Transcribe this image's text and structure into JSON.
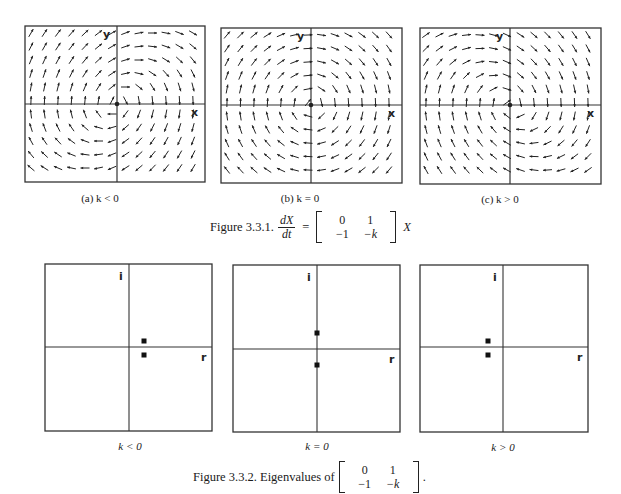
{
  "figure1": {
    "title": "Figure 3.3.1.",
    "equation": {
      "lhs_num": "dX",
      "lhs_den": "dt",
      "equals": "=",
      "matrix": [
        [
          "0",
          "1"
        ],
        [
          "−1",
          "−k"
        ]
      ],
      "rhs": "X"
    },
    "panels": [
      {
        "id": "a",
        "caption": "(a) k < 0",
        "k": -0.5,
        "box": [
          25,
          26,
          180,
          156
        ],
        "origin": [
          117,
          104
        ],
        "x_label": "x",
        "y_label": "y"
      },
      {
        "id": "b",
        "caption": "(b)  k = 0",
        "k": 0,
        "box": [
          221,
          28,
          181,
          155
        ],
        "origin": [
          311,
          105
        ],
        "x_label": "x",
        "y_label": "y"
      },
      {
        "id": "c",
        "caption": "(c)  k > 0",
        "k": 0.5,
        "box": [
          420,
          28,
          181,
          156
        ],
        "origin": [
          510,
          105
        ],
        "x_label": "x",
        "y_label": "y"
      }
    ]
  },
  "figure2": {
    "title": "Figure 3.3.2. Eigenvalues of",
    "matrix": [
      [
        "0",
        "1"
      ],
      [
        "−1",
        "−k"
      ]
    ],
    "trailing": ".",
    "panels": [
      {
        "caption": "k < 0",
        "box": [
          45,
          264,
          167,
          167
        ],
        "origin": [
          129,
          347
        ],
        "imag_label": "i",
        "real_label": "r",
        "eigenvalues": [
          [
            144,
            341
          ],
          [
            144,
            355
          ]
        ]
      },
      {
        "caption": "k = 0",
        "box": [
          233,
          265,
          167,
          167
        ],
        "origin": [
          317,
          349
        ],
        "imag_label": "i",
        "real_label": "r",
        "eigenvalues": [
          [
            317,
            333
          ],
          [
            317,
            365
          ]
        ]
      },
      {
        "caption": "k > 0",
        "box": [
          420,
          265,
          168,
          167
        ],
        "origin": [
          503,
          347
        ],
        "imag_label": "i",
        "real_label": "r",
        "eigenvalues": [
          [
            488,
            341
          ],
          [
            488,
            355
          ]
        ]
      }
    ]
  },
  "chart_data": [
    {
      "type": "vector_field",
      "title": "(a) k < 0",
      "system": "dx/dt = y, dy/dt = -x - k y",
      "k_sign": "negative",
      "behavior": "spiral source (unstable)",
      "axes": {
        "x": "x",
        "y": "y"
      }
    },
    {
      "type": "vector_field",
      "title": "(b) k = 0",
      "system": "dx/dt = y, dy/dt = -x",
      "k_sign": "zero",
      "behavior": "center (closed orbits)",
      "axes": {
        "x": "x",
        "y": "y"
      }
    },
    {
      "type": "vector_field",
      "title": "(c) k > 0",
      "system": "dx/dt = y, dy/dt = -x - k y",
      "k_sign": "positive",
      "behavior": "spiral sink (stable)",
      "axes": {
        "x": "x",
        "y": "y"
      }
    },
    {
      "type": "scatter",
      "title": "k < 0",
      "xlabel": "r",
      "ylabel": "i",
      "points": [
        {
          "r": "positive",
          "i": "+small"
        },
        {
          "r": "positive",
          "i": "-small"
        }
      ],
      "note": "complex conjugate eigenvalues with positive real part"
    },
    {
      "type": "scatter",
      "title": "k = 0",
      "xlabel": "r",
      "ylabel": "i",
      "points": [
        {
          "r": 0,
          "i": 1
        },
        {
          "r": 0,
          "i": -1
        }
      ],
      "note": "purely imaginary eigenvalues ±i"
    },
    {
      "type": "scatter",
      "title": "k > 0",
      "xlabel": "r",
      "ylabel": "i",
      "points": [
        {
          "r": "negative",
          "i": "+small"
        },
        {
          "r": "negative",
          "i": "-small"
        }
      ],
      "note": "complex conjugate eigenvalues with negative real part"
    }
  ],
  "style": {
    "ink": "#222222",
    "frame": "#333333",
    "background": "#ffffff"
  }
}
